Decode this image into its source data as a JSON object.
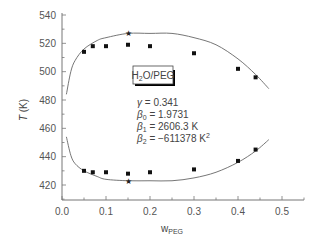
{
  "chart_data": {
    "type": "scatter",
    "title": "",
    "xlabel": "w",
    "xlabel_sub": "PEG",
    "ylabel": "T (K)",
    "xlim": [
      0.0,
      0.55
    ],
    "ylim": [
      410,
      540
    ],
    "x_ticks": [
      "0.0",
      "0.1",
      "0.2",
      "0.3",
      "0.4",
      "0.5"
    ],
    "y_ticks": [
      "420",
      "440",
      "460",
      "480",
      "500",
      "520",
      "540"
    ],
    "grid": false,
    "legend_box": {
      "label_main": "H",
      "label_sub": "2",
      "label_rest": "O/PEG"
    },
    "annotations": [
      {
        "symbol": "γ",
        "sub": "",
        "text": " = 0.341"
      },
      {
        "symbol": "β",
        "sub": "0",
        "text": " = 1.9731"
      },
      {
        "symbol": "β",
        "sub": "1",
        "text": " = 2606.3 K"
      },
      {
        "symbol": "β",
        "sub": "2",
        "text": " = −611378 K",
        "sup": "2"
      }
    ],
    "series": [
      {
        "name": "experimental upper (UCST branch)",
        "marker": "square",
        "x": [
          0.05,
          0.07,
          0.1,
          0.15,
          0.2,
          0.3,
          0.4,
          0.44
        ],
        "y": [
          514,
          518,
          518,
          519,
          518,
          513,
          502,
          496
        ]
      },
      {
        "name": "experimental lower (LCST branch)",
        "marker": "square",
        "x": [
          0.05,
          0.07,
          0.1,
          0.15,
          0.2,
          0.3,
          0.4,
          0.44
        ],
        "y": [
          430,
          429,
          429,
          428,
          429,
          431,
          437,
          445
        ]
      },
      {
        "name": "critical points",
        "marker": "star",
        "x": [
          0.15,
          0.15
        ],
        "y": [
          527,
          423
        ]
      },
      {
        "name": "model fit upper",
        "type": "line",
        "x": [
          0.01,
          0.02,
          0.03,
          0.05,
          0.08,
          0.1,
          0.15,
          0.2,
          0.25,
          0.3,
          0.35,
          0.4,
          0.44,
          0.47
        ],
        "y": [
          484,
          500,
          508,
          516,
          522,
          524,
          527,
          527,
          527,
          524,
          519,
          509,
          498,
          488
        ]
      },
      {
        "name": "model fit lower",
        "type": "line",
        "x": [
          0.01,
          0.02,
          0.03,
          0.05,
          0.08,
          0.1,
          0.15,
          0.2,
          0.25,
          0.3,
          0.35,
          0.4,
          0.44,
          0.47
        ],
        "y": [
          454,
          441,
          435,
          430,
          426,
          424,
          423,
          423,
          423,
          425,
          429,
          436,
          444,
          452
        ]
      }
    ]
  }
}
